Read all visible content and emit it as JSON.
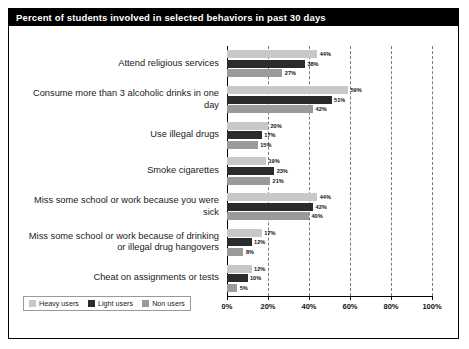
{
  "header": {
    "title": "Percent of students involved in selected behaviors in past 30 days"
  },
  "legend": {
    "items": [
      {
        "label": "Heavy users",
        "color": "#c8c8c8",
        "key": "heavy"
      },
      {
        "label": "Light users",
        "color": "#2b2b2b",
        "key": "light"
      },
      {
        "label": "Non users",
        "color": "#9a9a9a",
        "key": "non"
      }
    ]
  },
  "axis": {
    "ticks": [
      "0%",
      "20%",
      "40%",
      "60%",
      "80%",
      "100%"
    ]
  },
  "chart_data": {
    "type": "bar",
    "orientation": "horizontal",
    "title": "Percent of students involved in selected behaviors in past 30 days",
    "xlabel": "",
    "ylabel": "",
    "xlim": [
      0,
      100
    ],
    "xtick_step": 20,
    "grid": true,
    "legend_position": "bottom-left",
    "value_suffix": "%",
    "categories": [
      "Attend religious services",
      "Consume more than 3 alcoholic drinks in one day",
      "Use illegal drugs",
      "Smoke cigarettes",
      "Miss some school or work because you were sick",
      "Miss some school or work because of drinking or illegal drug hangovers",
      "Cheat on assignments or tests"
    ],
    "series": [
      {
        "name": "Heavy users",
        "color": "#c8c8c8",
        "values": [
          44,
          59,
          20,
          19,
          44,
          17,
          12
        ]
      },
      {
        "name": "Light users",
        "color": "#2b2b2b",
        "values": [
          38,
          51,
          17,
          23,
          42,
          12,
          10
        ]
      },
      {
        "name": "Non users",
        "color": "#9a9a9a",
        "values": [
          27,
          42,
          15,
          21,
          40,
          8,
          5
        ]
      }
    ],
    "labels": {
      "heavy": [
        "44%",
        "59%",
        "20%",
        "19%",
        "44%",
        "17%",
        "12%"
      ],
      "light": [
        "38%",
        "51%",
        "17%",
        "23%",
        "42%",
        "12%",
        "10%"
      ],
      "non": [
        "27%",
        "42%",
        "15%",
        "21%",
        "40%",
        "8%",
        "5%"
      ]
    }
  }
}
